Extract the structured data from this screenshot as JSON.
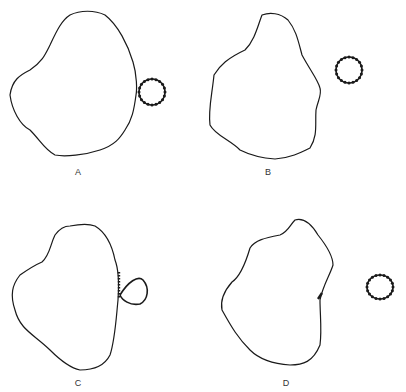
{
  "panels": [
    {
      "id": "A",
      "label": "A",
      "state": "ring attached to cell surface"
    },
    {
      "id": "B",
      "label": "B",
      "state": "ring separated from cell"
    },
    {
      "id": "C",
      "label": "C",
      "state": "ring partially fused with cell membrane"
    },
    {
      "id": "D",
      "label": "D",
      "state": "ring detached, beads left on membrane"
    }
  ],
  "colors": {
    "line": "#1a1a1a",
    "background": "#ffffff"
  }
}
